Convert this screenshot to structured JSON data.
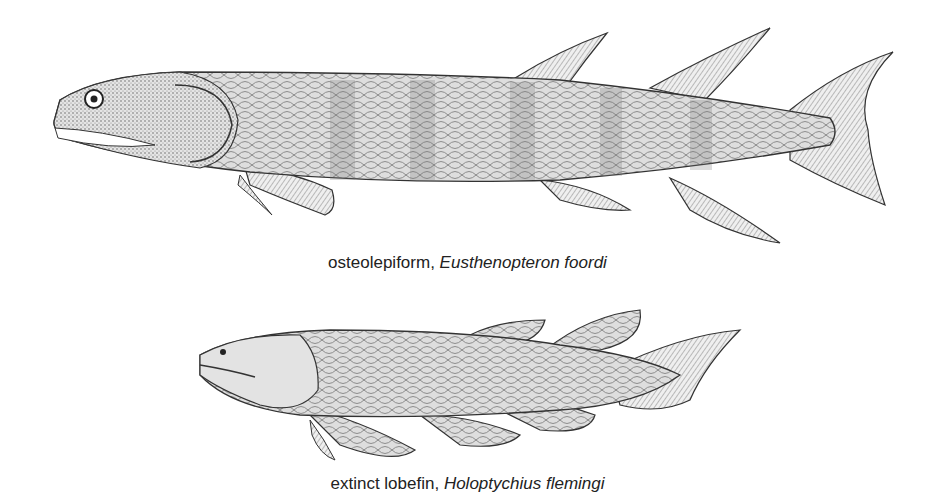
{
  "figures": [
    {
      "id": "eusthenopteron",
      "caption_common": "osteolepiform,",
      "caption_scientific": "Eusthenopteron foordi",
      "illustration": "pen-and-ink drawing of elongated lobe-finned fish with three-lobed tail, two dorsal fins, paired pectoral and pelvic fins, anal fin, banded scaled body"
    },
    {
      "id": "holoptychius",
      "caption_common": "extinct lobefin,",
      "caption_scientific": "Holoptychius flemingi",
      "illustration": "pen-and-ink drawing of stout lobe-finned fish with rounded fleshy lobed fins and asymmetric tail"
    }
  ],
  "colors": {
    "background": "#ffffff",
    "ink": "#222222",
    "body_fill": "#d9d9d9",
    "fin_fill": "#eeeeee"
  }
}
